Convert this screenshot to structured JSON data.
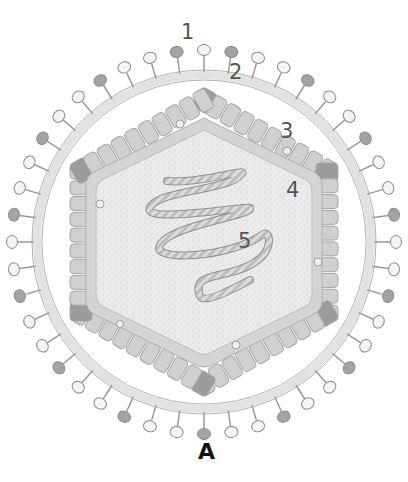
{
  "figure": {
    "caption": "A",
    "labels": [
      {
        "id": "1",
        "text": "1",
        "x": 181,
        "y": 22
      },
      {
        "id": "2",
        "text": "2",
        "x": 229,
        "y": 62
      },
      {
        "id": "3",
        "text": "3",
        "x": 280,
        "y": 121
      },
      {
        "id": "4",
        "text": "4",
        "x": 286,
        "y": 180
      },
      {
        "id": "5",
        "text": "5",
        "x": 238,
        "y": 231
      }
    ],
    "colors": {
      "background": "#ffffff",
      "envelope": "#e6e6e6",
      "envelope_stroke": "#a8a8a8",
      "spike_fill_light": "#f2f2f2",
      "spike_fill_dark": "#9a9a9a",
      "matrix_block": "#cfcfcf",
      "matrix_block_dark": "#9c9c9c",
      "capsid_ring": "#c9c9c9",
      "capsid_interior": "#e8e8e8",
      "genome": "#a0a0a0",
      "label_text": "#555555",
      "caption_text": "#111111"
    }
  }
}
